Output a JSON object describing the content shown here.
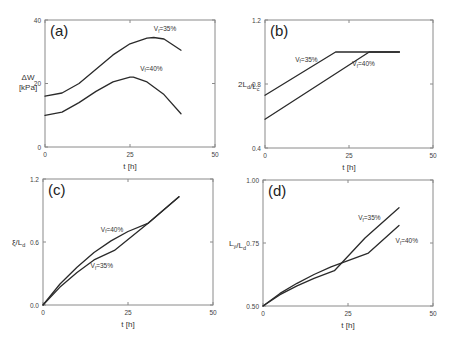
{
  "chart_data": [
    {
      "panel": "(a)",
      "type": "line",
      "xlabel": "t [h]",
      "ylabel": "ΔW [kPa]",
      "xlim": [
        0,
        50
      ],
      "ylim": [
        0,
        40
      ],
      "xticks": [
        "0",
        "25",
        "50"
      ],
      "yticks": [
        "0",
        "20",
        "40"
      ],
      "grid": false,
      "series": [
        {
          "name": "Vf=35%",
          "x": [
            0,
            5,
            10,
            15,
            20,
            25,
            30,
            32,
            35,
            40
          ],
          "y": [
            16,
            17,
            20,
            24.5,
            29,
            32.5,
            34.3,
            34.5,
            34,
            30.5
          ]
        },
        {
          "name": "Vf=40%",
          "x": [
            0,
            5,
            10,
            15,
            20,
            25,
            26,
            30,
            35,
            40
          ],
          "y": [
            10,
            11,
            14,
            17.5,
            20.5,
            22,
            22,
            20.5,
            16.5,
            10.5
          ]
        }
      ],
      "annotations": [
        {
          "text": "Vf=35%",
          "x": 32,
          "y": 36.5
        },
        {
          "text": "Vf=40%",
          "x": 28,
          "y": 24
        }
      ]
    },
    {
      "panel": "(b)",
      "type": "line",
      "xlabel": "t [h]",
      "ylabel": "2Ld/Lc",
      "xlim": [
        0,
        50
      ],
      "ylim": [
        0.4,
        1.2
      ],
      "xticks": [
        "0",
        "25",
        "50"
      ],
      "yticks": [
        "0.4",
        "0.8",
        "1.2"
      ],
      "grid": false,
      "series": [
        {
          "name": "Vf=35%",
          "x": [
            0,
            21,
            40
          ],
          "y": [
            0.73,
            1.0,
            1.0
          ]
        },
        {
          "name": "Vf=40%",
          "x": [
            0,
            31,
            40
          ],
          "y": [
            0.58,
            1.0,
            1.0
          ]
        }
      ],
      "annotations": [
        {
          "text": "Vf=35%",
          "x": 9,
          "y": 0.94
        },
        {
          "text": "Vf=40%",
          "x": 26,
          "y": 0.91
        }
      ]
    },
    {
      "panel": "(c)",
      "type": "line",
      "xlabel": "t [h]",
      "ylabel": "ξ/Ld",
      "xlim": [
        0,
        50
      ],
      "ylim": [
        0.0,
        1.2
      ],
      "xticks": [
        "0",
        "25",
        "50"
      ],
      "yticks": [
        "0.0",
        "0.6",
        "1.2"
      ],
      "grid": false,
      "series": [
        {
          "name": "Vf=40%",
          "x": [
            0,
            5,
            10,
            15,
            20,
            25,
            31,
            40
          ],
          "y": [
            0,
            0.2,
            0.36,
            0.5,
            0.61,
            0.7,
            0.78,
            1.03
          ]
        },
        {
          "name": "Vf=35%",
          "x": [
            0,
            5,
            10,
            15,
            21,
            31,
            40
          ],
          "y": [
            0,
            0.17,
            0.31,
            0.43,
            0.52,
            0.78,
            1.03
          ]
        }
      ],
      "annotations": [
        {
          "text": "Vf=40%",
          "x": 17,
          "y": 0.7
        },
        {
          "text": "Vf=35%",
          "x": 14,
          "y": 0.35
        }
      ]
    },
    {
      "panel": "(d)",
      "type": "line",
      "xlabel": "t [h]",
      "ylabel": "Ly/Ld",
      "xlim": [
        0,
        50
      ],
      "ylim": [
        0.5,
        1.0
      ],
      "xticks": [
        "0",
        "25",
        "50"
      ],
      "yticks": [
        "0.50",
        "0.75",
        "1.00"
      ],
      "grid": false,
      "series": [
        {
          "name": "Vf=35%",
          "x": [
            0,
            5,
            10,
            15,
            21,
            30,
            40
          ],
          "y": [
            0.5,
            0.545,
            0.58,
            0.61,
            0.64,
            0.77,
            0.89
          ]
        },
        {
          "name": "Vf=40%",
          "x": [
            0,
            5,
            10,
            15,
            20,
            25,
            31,
            40
          ],
          "y": [
            0.5,
            0.55,
            0.59,
            0.625,
            0.655,
            0.68,
            0.71,
            0.82
          ]
        }
      ],
      "annotations": [
        {
          "text": "Vf=35%",
          "x": 28,
          "y": 0.84
        },
        {
          "text": "Vf=40%",
          "x": 39,
          "y": 0.75
        }
      ]
    }
  ],
  "panels": [
    {
      "id": "a",
      "label": "(a)"
    },
    {
      "id": "b",
      "label": "(b)"
    },
    {
      "id": "c",
      "label": "(c)"
    },
    {
      "id": "d",
      "label": "(d)"
    }
  ]
}
